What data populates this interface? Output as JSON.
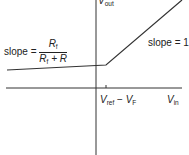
{
  "diagram": {
    "y_axis_label": {
      "main": "V",
      "sub": "out"
    },
    "x_axis_label": {
      "main": "V",
      "sub": "in"
    },
    "tick_label": {
      "a": "V",
      "a_sub": "ref",
      "minus": " − ",
      "b": "V",
      "b_sub": "F"
    },
    "left_slope": {
      "prefix": "slope = ",
      "num_main": "R",
      "num_sub": "f",
      "den_main": "R",
      "den_sub": "f",
      "den_rest": " + R"
    },
    "right_slope": "slope = 1",
    "line_color": "#333333"
  }
}
